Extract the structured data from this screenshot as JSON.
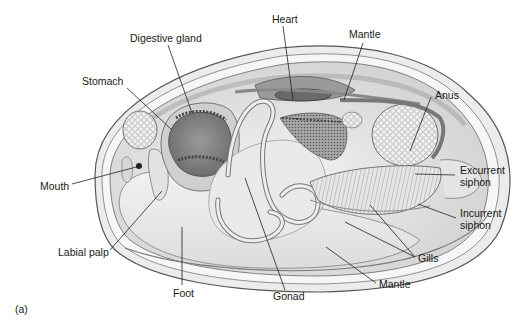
{
  "figure": {
    "panel_label": "(a)",
    "labels": {
      "digestive_gland": "Digestive gland",
      "heart": "Heart",
      "mantle_top": "Mantle",
      "stomach": "Stomach",
      "anus": "Anus",
      "excurrent_siphon_1": "Excurrent",
      "excurrent_siphon_2": "siphon",
      "incurrent_siphon_1": "Incurrent",
      "incurrent_siphon_2": "siphon",
      "mouth": "Mouth",
      "labial_palp": "Labial palp",
      "foot": "Foot",
      "gonad": "Gonad",
      "mantle_bottom": "Mantle",
      "gills": "Gills"
    }
  }
}
